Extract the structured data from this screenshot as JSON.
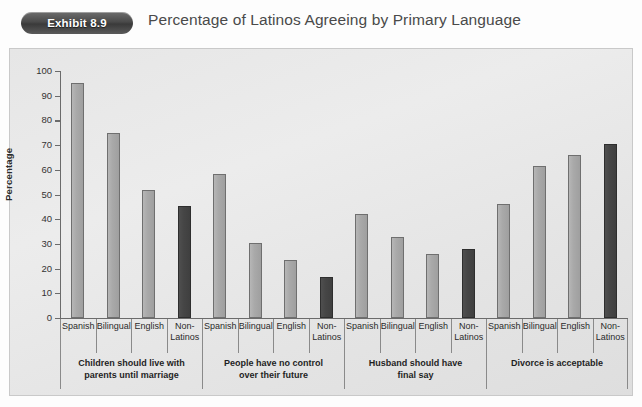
{
  "header": {
    "exhibit_badge": "Exhibit 8.9",
    "title": "Percentage of Latinos Agreeing by Primary Language"
  },
  "colors": {
    "bar_light": "#a9a9a9",
    "bar_dark": "#464646",
    "axis": "#6b6b6b",
    "plot_background": "#e6e6e6",
    "badge": "#4a4a4a"
  },
  "chart_data": {
    "type": "bar",
    "title": "Percentage of Latinos Agreeing by Primary Language",
    "xlabel": "",
    "ylabel": "Percentage",
    "ylim": [
      0,
      100
    ],
    "yticks": [
      0,
      10,
      20,
      30,
      40,
      50,
      60,
      70,
      80,
      90,
      100
    ],
    "grid": false,
    "legend_position": "none",
    "categories": [
      "Spanish",
      "Bilingual",
      "English",
      "Non-Latinos"
    ],
    "groups": [
      {
        "label": "Children should live with parents until marriage",
        "label_lines": [
          "Children should live with",
          "parents until marriage"
        ],
        "values": [
          95,
          75,
          52,
          45.5
        ]
      },
      {
        "label": "People have no control over their future",
        "label_lines": [
          "People have no control",
          "over their future"
        ],
        "values": [
          58.5,
          30.5,
          23.5,
          16.5
        ]
      },
      {
        "label": "Husband should have final say",
        "label_lines": [
          "Husband should have",
          "final say"
        ],
        "values": [
          42,
          33,
          26,
          28
        ]
      },
      {
        "label": "Divorce is acceptable",
        "label_lines": [
          "Divorce is acceptable",
          ""
        ],
        "values": [
          46,
          61.5,
          66,
          70.5
        ]
      }
    ],
    "category_label_lines": {
      "Spanish": [
        "Spanish",
        ""
      ],
      "Bilingual": [
        "Bilingual",
        ""
      ],
      "English": [
        "English",
        ""
      ],
      "Non-Latinos": [
        "Non-",
        "Latinos"
      ]
    },
    "series_styles": {
      "Spanish": "light",
      "Bilingual": "light",
      "English": "light",
      "Non-Latinos": "dark"
    }
  }
}
